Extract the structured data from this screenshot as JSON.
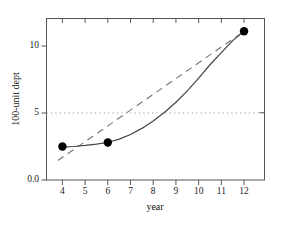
{
  "chart_data": {
    "type": "line",
    "title": "",
    "xlabel": "year",
    "ylabel": "100-unit dept",
    "xlim": [
      3.3,
      12.9
    ],
    "ylim": [
      0,
      12.05
    ],
    "xticks": [
      4,
      5,
      6,
      7,
      8,
      9,
      10,
      11,
      12
    ],
    "xticklabels": [
      "4",
      "5",
      "6",
      "7",
      "8",
      "9",
      "10",
      "11",
      "12"
    ],
    "yticks": [
      0,
      5,
      10
    ],
    "yticklabels": [
      "0.0",
      "5",
      "10"
    ],
    "grid": false,
    "legend": null,
    "series": [
      {
        "name": "observed points",
        "type": "scatter",
        "marker": "filled-circle",
        "color": "#000000",
        "x": [
          4,
          6,
          12
        ],
        "values": [
          2.5,
          2.8,
          11.1
        ]
      },
      {
        "name": "fitted curve",
        "type": "line",
        "style": "solid",
        "color": "#444444",
        "x": [
          4.0,
          4.5,
          5.0,
          5.5,
          6.0,
          6.5,
          7.0,
          7.5,
          8.0,
          8.5,
          9.0,
          9.5,
          10.0,
          10.5,
          11.0,
          11.5,
          12.0
        ],
        "values": [
          2.45,
          2.5,
          2.58,
          2.68,
          2.8,
          3.05,
          3.4,
          3.85,
          4.4,
          5.05,
          5.8,
          6.65,
          7.6,
          8.6,
          9.5,
          10.4,
          11.1
        ]
      },
      {
        "name": "linear trend",
        "type": "line",
        "style": "dashed",
        "color": "#777777",
        "x": [
          3.8,
          12.0
        ],
        "values": [
          1.45,
          11.1
        ]
      }
    ],
    "reference_lines": [
      {
        "name": "threshold",
        "orientation": "horizontal",
        "value": 5,
        "style": "dotted",
        "color": "#999999"
      }
    ],
    "axis_frame_color": "#555555"
  },
  "axes": {
    "x_title": "year",
    "y_title": "100-unit dept"
  }
}
